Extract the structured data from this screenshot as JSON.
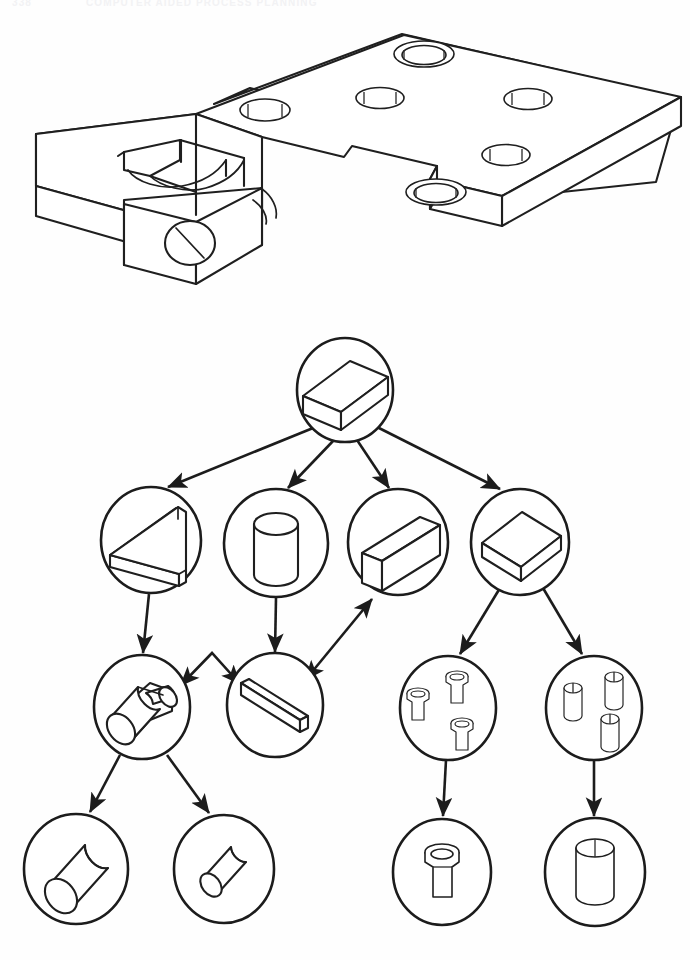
{
  "page": {
    "header_number": "338",
    "header_title": "COMPUTER AIDED PROCESS PLANNING",
    "background_color": "#fefefe",
    "ink_color": "#1c1c1c",
    "width": 690,
    "height": 960
  },
  "figure": {
    "caption": "",
    "part_drawing": {
      "name": "isometric-machined-part",
      "description": "Isometric line drawing of a machined bracket plate with stepped boss, open slot, side bore and five top holes",
      "features": [
        {
          "name": "base-plate",
          "type": "plate"
        },
        {
          "name": "counterbored-hole-rear",
          "type": "counterbored-hole"
        },
        {
          "name": "plain-hole-left",
          "type": "through-hole"
        },
        {
          "name": "plain-hole-center",
          "type": "through-hole"
        },
        {
          "name": "plain-hole-right",
          "type": "through-hole"
        },
        {
          "name": "counterbored-hole-front",
          "type": "counterbored-hole"
        },
        {
          "name": "side-bore",
          "type": "through-hole"
        },
        {
          "name": "open-slot",
          "type": "slot"
        },
        {
          "name": "step-pocket",
          "type": "pocket"
        }
      ]
    },
    "tree": {
      "orientation": "top-down",
      "levels": 4,
      "nodes": [
        {
          "id": "n0",
          "level": 0,
          "shape": "block",
          "label": "raw-stock-block",
          "cx": 345,
          "cy": 390,
          "rx": 48,
          "ry": 52
        },
        {
          "id": "n1",
          "level": 1,
          "shape": "thin-slab",
          "label": "thin-slab",
          "cx": 151,
          "cy": 540,
          "rx": 50,
          "ry": 53
        },
        {
          "id": "n2",
          "level": 1,
          "shape": "cylinder",
          "label": "cylinder",
          "cx": 276,
          "cy": 543,
          "rx": 52,
          "ry": 54
        },
        {
          "id": "n3",
          "level": 1,
          "shape": "bar-block",
          "label": "rectangular-bar",
          "cx": 398,
          "cy": 542,
          "rx": 50,
          "ry": 53
        },
        {
          "id": "n4",
          "level": 1,
          "shape": "flat-plate",
          "label": "flat-plate",
          "cx": 520,
          "cy": 542,
          "rx": 49,
          "ry": 52
        },
        {
          "id": "n5",
          "level": 2,
          "shape": "stepped-cylinder",
          "label": "stepped-cylinder",
          "cx": 142,
          "cy": 707,
          "rx": 48,
          "ry": 52
        },
        {
          "id": "n6",
          "level": 2,
          "shape": "thin-slab",
          "label": "thin-slab",
          "cx": 275,
          "cy": 705,
          "rx": 48,
          "ry": 52
        },
        {
          "id": "n7",
          "level": 2,
          "shape": "three-counterbores",
          "label": "three-counterbored-holes",
          "cx": 448,
          "cy": 708,
          "rx": 48,
          "ry": 52
        },
        {
          "id": "n8",
          "level": 2,
          "shape": "three-plain-holes",
          "label": "three-plain-holes",
          "cx": 594,
          "cy": 708,
          "rx": 48,
          "ry": 52
        },
        {
          "id": "n9",
          "level": 3,
          "shape": "cylinder-large",
          "label": "large-cylinder",
          "cx": 76,
          "cy": 869,
          "rx": 52,
          "ry": 55
        },
        {
          "id": "n10",
          "level": 3,
          "shape": "cylinder-small",
          "label": "small-cylinder",
          "cx": 224,
          "cy": 869,
          "rx": 50,
          "ry": 54
        },
        {
          "id": "n11",
          "level": 3,
          "shape": "counterbore",
          "label": "counterbored-hole",
          "cx": 442,
          "cy": 872,
          "rx": 49,
          "ry": 53
        },
        {
          "id": "n12",
          "level": 3,
          "shape": "plain-hole",
          "label": "plain-hole",
          "cx": 595,
          "cy": 872,
          "rx": 50,
          "ry": 54
        }
      ],
      "edges": [
        {
          "from": "n0",
          "to": "n1",
          "type": "single"
        },
        {
          "from": "n0",
          "to": "n2",
          "type": "single"
        },
        {
          "from": "n0",
          "to": "n3",
          "type": "single"
        },
        {
          "from": "n0",
          "to": "n4",
          "type": "single"
        },
        {
          "from": "n1",
          "to": "n5",
          "type": "single"
        },
        {
          "from": "n2",
          "to": "n6",
          "type": "single"
        },
        {
          "from": "n5",
          "to": "n6",
          "type": "double"
        },
        {
          "from": "n6",
          "to": "n3",
          "type": "double"
        },
        {
          "from": "n4",
          "to": "n7",
          "type": "single"
        },
        {
          "from": "n4",
          "to": "n8",
          "type": "single"
        },
        {
          "from": "n5",
          "to": "n9",
          "type": "single"
        },
        {
          "from": "n5",
          "to": "n10",
          "type": "single"
        },
        {
          "from": "n7",
          "to": "n11",
          "type": "single"
        },
        {
          "from": "n8",
          "to": "n12",
          "type": "single"
        }
      ]
    }
  }
}
